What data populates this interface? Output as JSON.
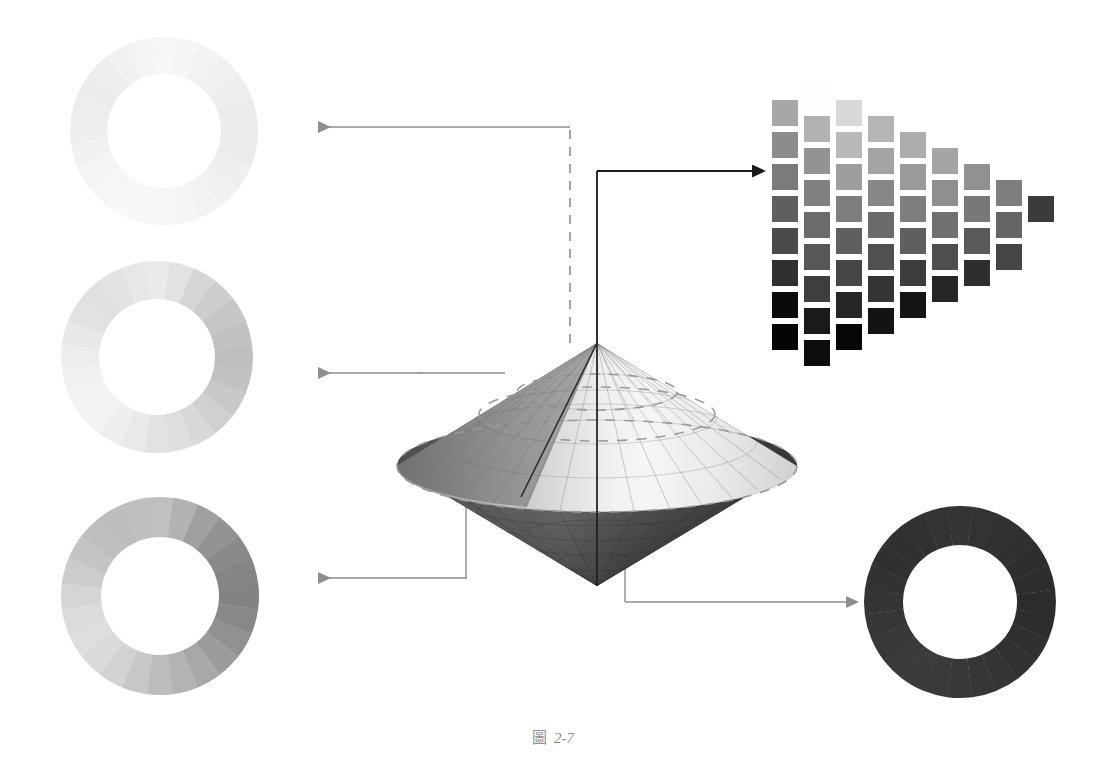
{
  "figure": {
    "caption_label": "圖",
    "caption_number": "2-7",
    "caption_full": "圖 2-7",
    "background": "#ffffff"
  },
  "chart_data": {
    "type": "diagram",
    "title": "圖 2-7",
    "subtitle": "Colour solid: vertical lightness axis, radial saturation, circular hue",
    "xlabel": "",
    "ylabel": "",
    "legend_position": "none",
    "grid": false,
    "components": [
      {
        "id": "hue-ring-high",
        "name": "High lightness hue ring",
        "position": "top-left",
        "cx": 164,
        "cy": 131,
        "r_outer": 94,
        "r_inner": 57,
        "segments": 24,
        "lightness_level": "very light",
        "mean_gray": "#f2f2f2",
        "values": [
          "#f7f7f7",
          "#f5f5f5",
          "#f2f2f2",
          "#f0f0f0",
          "#eeeeee",
          "#ececec",
          "#ebebeb",
          "#ececec",
          "#efefef",
          "#f1f1f1",
          "#f3f3f3",
          "#f5f5f5",
          "#f6f6f6",
          "#f7f7f7",
          "#f8f8f8",
          "#f6f6f6",
          "#f4f4f4",
          "#f1f1f1",
          "#efefef",
          "#ededed",
          "#ececec",
          "#eeeeee",
          "#f1f1f1",
          "#f4f4f4"
        ]
      },
      {
        "id": "hue-ring-upper-mid",
        "name": "Upper-middle lightness hue ring",
        "position": "middle-left",
        "cx": 157,
        "cy": 357,
        "r_outer": 96,
        "r_inner": 58,
        "segments": 24,
        "lightness_level": "light",
        "mean_gray": "#dcdcdc",
        "values": [
          "#eaeaea",
          "#e2e2e2",
          "#d6d6d6",
          "#cdcdcd",
          "#c6c6c6",
          "#c2c2c2",
          "#bfbfbf",
          "#c2c2c2",
          "#c8c8c8",
          "#d0d0d0",
          "#d8d8d8",
          "#dedede",
          "#e2e2e2",
          "#e9e9e9",
          "#efefef",
          "#f2f2f2",
          "#f3f3f3",
          "#f1f1f1",
          "#ededed",
          "#e8e8e8",
          "#e2e2e2",
          "#e0e0e0",
          "#e3e3e3",
          "#e7e7e7"
        ]
      },
      {
        "id": "hue-ring-mid",
        "name": "Mid lightness hue ring (maximum saturation)",
        "position": "bottom-left",
        "cx": 160,
        "cy": 596,
        "r_outer": 99,
        "r_inner": 59,
        "segments": 24,
        "lightness_level": "medium",
        "mean_gray": "#a8a8a8",
        "values": [
          "#c0c0c0",
          "#b2b2b2",
          "#a0a0a0",
          "#939393",
          "#8a8a8a",
          "#858585",
          "#838383",
          "#888888",
          "#919191",
          "#9c9c9c",
          "#a8a8a8",
          "#b3b3b3",
          "#bcbcbc",
          "#c7c7c7",
          "#d2d2d2",
          "#dadada",
          "#dedede",
          "#dcdcdc",
          "#d5d5d5",
          "#cccccc",
          "#c4c4c4",
          "#bfbfbf",
          "#bdbdbd",
          "#bfbfbf"
        ]
      },
      {
        "id": "hue-ring-dark",
        "name": "Low lightness hue ring",
        "position": "bottom-right",
        "cx": 960,
        "cy": 602,
        "r_outer": 96,
        "r_inner": 57,
        "segments": 24,
        "lightness_level": "very dark",
        "mean_gray": "#333333",
        "values": [
          "#343434",
          "#333333",
          "#313131",
          "#303030",
          "#2e2e2e",
          "#2d2d2d",
          "#2c2c2c",
          "#2d2d2d",
          "#2f2f2f",
          "#313131",
          "#343434",
          "#363636",
          "#383838",
          "#3a3a3a",
          "#3b3b3b",
          "#3a3a3a",
          "#383838",
          "#363636",
          "#343434",
          "#323232",
          "#303030",
          "#303030",
          "#313131",
          "#333333"
        ]
      },
      {
        "id": "color-solid",
        "name": "Double cone colour solid",
        "position": "center",
        "apex_top": [
          597,
          343
        ],
        "apex_bottom": [
          597,
          586
        ],
        "equator_cx": 597,
        "equator_cy": 466,
        "equator_rx": 200,
        "equator_ry": 46,
        "axis_label": "vertical lightness axis",
        "meridians": 24,
        "latitudes": 6
      },
      {
        "id": "tone-chart",
        "name": "Triangular tone / saturation chart",
        "position": "top-right",
        "columns": 9,
        "swatch_size": 26,
        "col_gap": 32,
        "row_gap": 32,
        "description": "Each column steps one level toward lower saturation; rows step toward lower lightness.",
        "columns_data": [
          {
            "col": 1,
            "count": 9,
            "top_y": 68,
            "values": [
              "#ffffff",
              "#a7a7a7",
              "#8c8c8c",
              "#7b7b7b",
              "#5f5f5f",
              "#4b4b4b",
              "#303030",
              "#0a0a0a",
              "#050505"
            ]
          },
          {
            "col": 2,
            "count": 9,
            "top_y": 84,
            "values": [
              "#fdfdfd",
              "#b1b1b1",
              "#939393",
              "#818181",
              "#6b6b6b",
              "#575757",
              "#3e3e3e",
              "#1a1a1a",
              "#0d0d0d"
            ]
          },
          {
            "col": 3,
            "count": 8,
            "top_y": 100,
            "values": [
              "#d8d8d8",
              "#b9b9b9",
              "#9e9e9e",
              "#7e7e7e",
              "#5f5f5f",
              "#464646",
              "#262626",
              "#070707"
            ]
          },
          {
            "col": 4,
            "count": 7,
            "top_y": 116,
            "values": [
              "#b5b5b5",
              "#a3a3a3",
              "#878787",
              "#6a6a6a",
              "#505050",
              "#343434",
              "#131313"
            ]
          },
          {
            "col": 5,
            "count": 6,
            "top_y": 132,
            "values": [
              "#adadad",
              "#9a9a9a",
              "#7e7e7e",
              "#5f5f5f",
              "#3d3d3d",
              "#141414"
            ]
          },
          {
            "col": 6,
            "count": 5,
            "top_y": 148,
            "values": [
              "#a5a5a5",
              "#8f8f8f",
              "#707070",
              "#4e4e4e",
              "#262626"
            ]
          },
          {
            "col": 7,
            "count": 4,
            "top_y": 164,
            "values": [
              "#919191",
              "#787878",
              "#5a5a5a",
              "#2e2e2e"
            ]
          },
          {
            "col": 8,
            "count": 3,
            "top_y": 180,
            "values": [
              "#7e7e7e",
              "#656565",
              "#454545"
            ]
          },
          {
            "col": 9,
            "count": 1,
            "top_y": 196,
            "values": [
              "#3b3b3b"
            ]
          }
        ]
      }
    ],
    "connectors": [
      {
        "id": "c1",
        "from": "color-solid axis top",
        "to": "hue-ring-high",
        "style": "dashed-vertical + solid-horizontal",
        "arrow": "left",
        "color": "#8e8e8e"
      },
      {
        "id": "c2",
        "from": "color-solid upper surface",
        "to": "hue-ring-upper-mid",
        "style": "solid",
        "arrow": "left",
        "color": "#8e8e8e"
      },
      {
        "id": "c3",
        "from": "color-solid equator edge",
        "to": "hue-ring-mid",
        "style": "solid",
        "arrow": "left",
        "color": "#8e8e8e"
      },
      {
        "id": "c4",
        "from": "color-solid bottom apex",
        "to": "hue-ring-dark",
        "style": "solid",
        "arrow": "right",
        "color": "#8e8e8e"
      },
      {
        "id": "c5",
        "from": "color-solid axis",
        "to": "tone-chart",
        "style": "solid",
        "arrow": "right",
        "color": "#1a1a1a"
      }
    ]
  },
  "colors": {
    "background": "#ffffff",
    "connector_grey": "#8e8e8e",
    "connector_black": "#1a1a1a",
    "caption_grey": "#8d8d8d",
    "dash_grey": "#9a9a9a"
  }
}
